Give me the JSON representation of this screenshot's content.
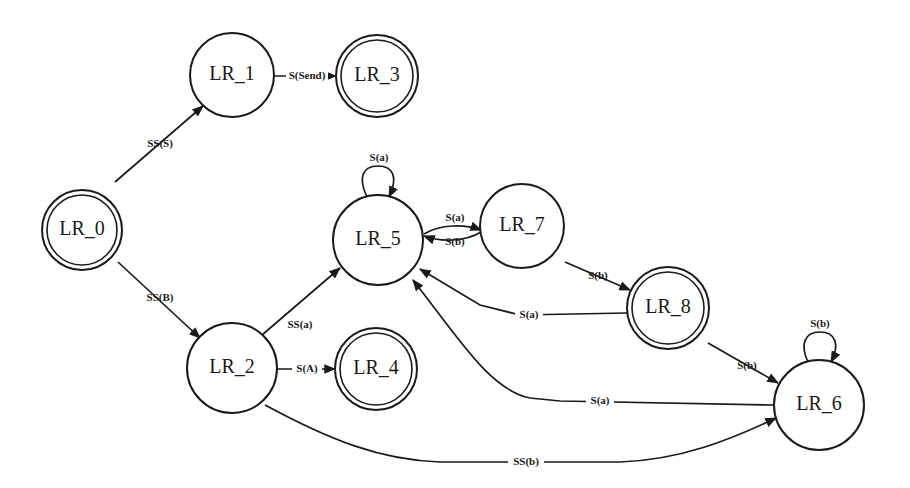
{
  "diagram": {
    "type": "state-machine",
    "background": "#ffffff",
    "stroke_color": "#1a1a1a",
    "nodes": [
      {
        "id": "LR_0",
        "label": "LR_0",
        "cx": 82,
        "cy": 230,
        "r": 40,
        "accepting": true
      },
      {
        "id": "LR_1",
        "label": "LR_1",
        "cx": 232,
        "cy": 75,
        "r": 42,
        "accepting": false
      },
      {
        "id": "LR_3",
        "label": "LR_3",
        "cx": 377,
        "cy": 76,
        "r": 41,
        "accepting": true
      },
      {
        "id": "LR_5",
        "label": "LR_5",
        "cx": 378,
        "cy": 240,
        "r": 45,
        "accepting": false
      },
      {
        "id": "LR_7",
        "label": "LR_7",
        "cx": 522,
        "cy": 226,
        "r": 42,
        "accepting": false
      },
      {
        "id": "LR_8",
        "label": "LR_8",
        "cx": 668,
        "cy": 308,
        "r": 41,
        "accepting": true
      },
      {
        "id": "LR_2",
        "label": "LR_2",
        "cx": 232,
        "cy": 368,
        "r": 45,
        "accepting": false
      },
      {
        "id": "LR_4",
        "label": "LR_4",
        "cx": 376,
        "cy": 369,
        "r": 41,
        "accepting": true
      },
      {
        "id": "LR_6",
        "label": "LR_6",
        "cx": 819,
        "cy": 405,
        "r": 45,
        "accepting": false
      }
    ],
    "edges": [
      {
        "from": "LR_0",
        "to": "LR_1",
        "label": "SS(S)"
      },
      {
        "from": "LR_0",
        "to": "LR_2",
        "label": "SS(B)"
      },
      {
        "from": "LR_1",
        "to": "LR_3",
        "label": "S(Send)"
      },
      {
        "from": "LR_2",
        "to": "LR_5",
        "label": "SS(a)"
      },
      {
        "from": "LR_2",
        "to": "LR_4",
        "label": "S(A)"
      },
      {
        "from": "LR_2",
        "to": "LR_6",
        "label": "SS(b)"
      },
      {
        "from": "LR_5",
        "to": "LR_5",
        "label": "S(a)"
      },
      {
        "from": "LR_5",
        "to": "LR_7",
        "label": "S(a)"
      },
      {
        "from": "LR_7",
        "to": "LR_5",
        "label": "S(b)"
      },
      {
        "from": "LR_7",
        "to": "LR_8",
        "label": "S(b)"
      },
      {
        "from": "LR_8",
        "to": "LR_5",
        "label": "S(a)"
      },
      {
        "from": "LR_8",
        "to": "LR_6",
        "label": "S(b)"
      },
      {
        "from": "LR_6",
        "to": "LR_5",
        "label": "S(a)"
      },
      {
        "from": "LR_6",
        "to": "LR_6",
        "label": "S(b)"
      }
    ]
  },
  "labels": {
    "n0": "LR_0",
    "n1": "LR_1",
    "n2": "LR_2",
    "n3": "LR_3",
    "n4": "LR_4",
    "n5": "LR_5",
    "n6": "LR_6",
    "n7": "LR_7",
    "n8": "LR_8",
    "e_0_1": "SS(S)",
    "e_0_2": "SS(B)",
    "e_1_3": "S(Send)",
    "e_2_5": "SS(a)",
    "e_2_4": "S(A)",
    "e_2_6": "SS(b)",
    "e_5_5": "S(a)",
    "e_5_7": "S(a)",
    "e_7_5": "S(b)",
    "e_7_8": "S(b)",
    "e_8_5": "S(a)",
    "e_8_6": "S(b)",
    "e_6_5": "S(a)",
    "e_6_6": "S(b)"
  }
}
